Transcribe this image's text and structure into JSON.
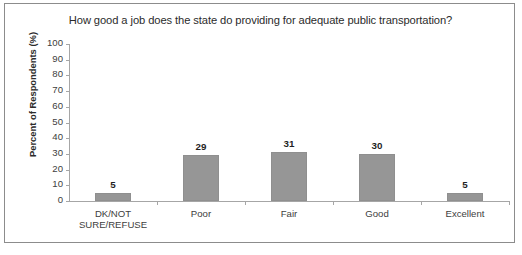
{
  "chart_data": {
    "type": "bar",
    "title": "How good a job does the state do providing for adequate public transportation?",
    "xlabel": "",
    "ylabel": "Percent of Respondents (%)",
    "categories": [
      "DK/NOT\nSURE/REFUSE",
      "Poor",
      "Fair",
      "Good",
      "Excellent"
    ],
    "values": [
      5,
      29,
      31,
      30,
      5
    ],
    "value_labels": [
      "5",
      "29",
      "31",
      "30",
      "5"
    ],
    "ylim": [
      0,
      100
    ],
    "yticks": [
      "100",
      "90",
      "80",
      "70",
      "60",
      "50",
      "40",
      "30",
      "20",
      "10",
      "0"
    ],
    "grid": false,
    "legend": false,
    "bar_color": "#969696",
    "axis_color": "#a6a6a6",
    "frame_color": "#8c8c8c",
    "text_color": "#2b2b2b"
  }
}
